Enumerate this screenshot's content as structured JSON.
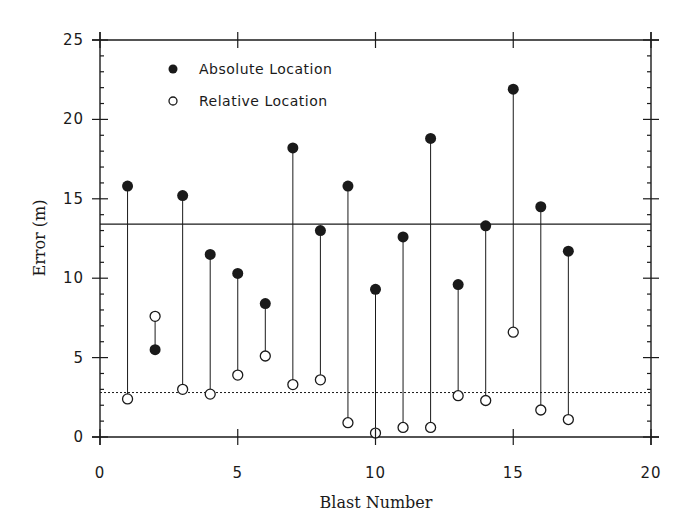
{
  "chart_data": {
    "type": "scatter",
    "title": "",
    "xlabel": "Blast Number",
    "ylabel": "Error  (m)",
    "xlim": [
      0,
      20
    ],
    "ylim": [
      0,
      25
    ],
    "x_ticks": [
      0,
      5,
      10,
      15,
      20
    ],
    "y_ticks": [
      0,
      5,
      10,
      15,
      20,
      25
    ],
    "grid": false,
    "legend_position": "upper-left",
    "x": [
      1,
      2,
      3,
      4,
      5,
      6,
      7,
      8,
      9,
      10,
      11,
      12,
      13,
      14,
      15,
      16,
      17
    ],
    "series": [
      {
        "name": "Absolute Location",
        "marker": "filled-circle",
        "values": [
          15.8,
          5.5,
          15.2,
          11.5,
          10.3,
          8.4,
          18.2,
          13.0,
          15.8,
          9.3,
          12.6,
          18.8,
          9.6,
          13.3,
          21.9,
          14.5,
          11.7
        ]
      },
      {
        "name": "Relative Location",
        "marker": "open-circle",
        "values": [
          2.4,
          7.6,
          3.0,
          2.7,
          3.9,
          5.1,
          3.3,
          3.6,
          0.9,
          0.25,
          0.6,
          0.6,
          2.6,
          2.3,
          6.6,
          1.7,
          1.1
        ]
      }
    ],
    "reference_lines": [
      {
        "name": "mean-absolute-error",
        "style": "solid",
        "y": 13.4
      },
      {
        "name": "mean-relative-error",
        "style": "dotted",
        "y": 2.8
      }
    ],
    "connectors": "vertical line joining absolute and relative error for each blast"
  },
  "legend": {
    "absolute_label": "Absolute Location",
    "relative_label": "Relative Location"
  },
  "axes": {
    "xlabel": "Blast Number",
    "ylabel": "Error  (m)",
    "x_tick_labels": [
      "0",
      "5",
      "10",
      "15",
      "20"
    ],
    "y_tick_labels": [
      "0",
      "5",
      "10",
      "15",
      "20",
      "25"
    ]
  },
  "colors": {
    "ink": "#1a1a1a",
    "background": "#ffffff"
  }
}
